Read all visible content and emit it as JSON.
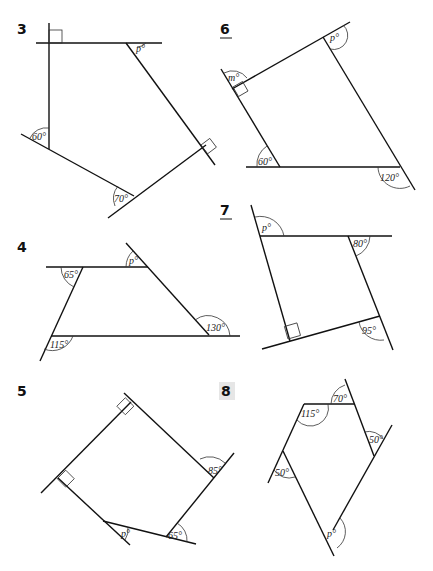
{
  "problems": [
    {
      "number": "3",
      "underlined": false,
      "angles": [
        "p°",
        "60°",
        "70°"
      ]
    },
    {
      "number": "6",
      "underlined": true,
      "angles": [
        "m°",
        "p°",
        "60°",
        "120°"
      ]
    },
    {
      "number": "4",
      "underlined": false,
      "angles": [
        "65°",
        "p°",
        "115°",
        "130°"
      ]
    },
    {
      "number": "7",
      "underlined": true,
      "angles": [
        "p°",
        "80°",
        "95°"
      ]
    },
    {
      "number": "5",
      "underlined": false,
      "angles": [
        "85°",
        "p°",
        "65°"
      ]
    },
    {
      "number": "8",
      "underlined": false,
      "highlighted": true,
      "angles": [
        "70°",
        "115°",
        "50°",
        "50°",
        "p°"
      ]
    }
  ]
}
